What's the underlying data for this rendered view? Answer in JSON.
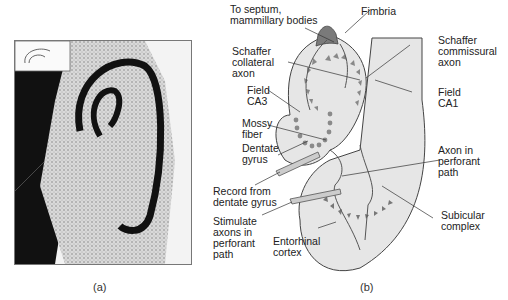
{
  "panel_a": {
    "caption": "(a)",
    "description": "Micrograph of hippocampal slice with inset schematic"
  },
  "panel_b": {
    "caption": "(b)",
    "labels": {
      "septum": "To septum,\nmammillary bodies",
      "fimbria": "Fimbria",
      "schaffer_collateral": "Schaffer\ncollateral\naxon",
      "schaffer_commissural": "Schaffer\ncommissural\naxon",
      "ca3": "Field\nCA3",
      "ca1": "Field\nCA1",
      "mossy": "Mossy\nfiber",
      "dentate": "Dentate\ngyrus",
      "record": "Record from\ndentate gyrus",
      "stimulate": "Stimulate\naxons in\nperforant\npath",
      "entorhinal": "Entorhinal\ncortex",
      "perforant_axon": "Axon in\nperforant\npath",
      "subicular": "Subicular\ncomplex"
    }
  },
  "colors": {
    "tissue": "#e4e4e4",
    "fimbria": "#7a7a7a",
    "cells": "#8a8a8a",
    "lines": "#333333"
  }
}
